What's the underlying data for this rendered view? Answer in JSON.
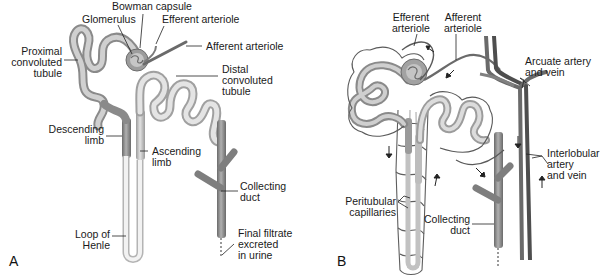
{
  "figure": {
    "panels": [
      {
        "id": "A",
        "letter": "A",
        "labels": {
          "bowman_capsule": "Bowman capsule",
          "glomerulus": "Glomerulus",
          "efferent_arteriole": "Efferent arteriole",
          "afferent_arteriole": "Afferent arteriole",
          "proximal_convoluted_tubule": "Proximal\nconvoluted\ntubule",
          "distal_convoluted_tubule": "Distal\nconvoluted\ntubule",
          "descending_limb": "Descending\nlimb",
          "ascending_limb": "Ascending\nlimb",
          "collecting_duct": "Collecting\nduct",
          "loop_of_henle": "Loop of\nHenle",
          "final_filtrate": "Final filtrate\nexcreted\nin urine"
        }
      },
      {
        "id": "B",
        "letter": "B",
        "labels": {
          "efferent_arteriole": "Efferent\narteriole",
          "afferent_arteriole": "Afferent\narteriole",
          "arcuate_artery_vein": "Arcuate artery\nand vein",
          "interlobular_artery_vein": "Interlobular\nartery\nand vein",
          "peritubular_capillaries": "Peritubular\ncapillaries",
          "collecting_duct": "Collecting\nduct"
        }
      }
    ],
    "colors": {
      "tubule_light": "#d4d4d4",
      "tubule_mid": "#a8a8a8",
      "tubule_dark": "#7a7a7a",
      "vessel": "#6e6e6e",
      "vessel_dark": "#555555",
      "capillary": "#5a5a5a",
      "leader": "#222222",
      "text": "#1a1a1a"
    }
  }
}
